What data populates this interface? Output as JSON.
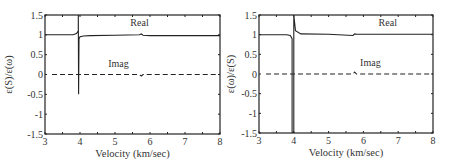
{
  "chart_data": [
    {
      "type": "line",
      "title": "",
      "xlabel": "Velocity (km/sec)",
      "ylabel": "ε(S)/ε(ω)",
      "xlim": [
        3,
        8
      ],
      "ylim": [
        -1.5,
        1.5
      ],
      "xticks": [
        "3",
        "4",
        "5",
        "6",
        "7",
        "8"
      ],
      "yticks": [
        "1.5",
        "1",
        "0.5",
        "0",
        "-0.5",
        "-1",
        "-1.5"
      ],
      "grid": false,
      "annotations": [
        {
          "text": "Real",
          "x": 5.7,
          "y": 1.22
        },
        {
          "text": "Imag",
          "x": 5.1,
          "y": 0.2
        }
      ],
      "series": [
        {
          "name": "Real",
          "style": "solid",
          "x": [
            3.0,
            3.8,
            3.9,
            3.95,
            3.95,
            3.96,
            3.97,
            4.0,
            4.1,
            4.3,
            5.0,
            5.7,
            5.75,
            5.8,
            6.0,
            8.0
          ],
          "y": [
            1.0,
            1.0,
            1.03,
            1.1,
            1.5,
            -0.5,
            0.9,
            0.95,
            0.97,
            0.98,
            0.99,
            1.0,
            1.02,
            0.99,
            0.98,
            0.98
          ]
        },
        {
          "name": "Imag",
          "style": "dashed",
          "x": [
            3.2,
            5.7,
            5.75,
            5.8,
            8.0
          ],
          "y": [
            0.0,
            0.0,
            -0.04,
            0.0,
            0.0
          ]
        }
      ]
    },
    {
      "type": "line",
      "title": "",
      "xlabel": "Velocity (km/sec)",
      "ylabel": "ε(ω)/ε(S)",
      "xlim": [
        3,
        8
      ],
      "ylim": [
        -1.5,
        1.5
      ],
      "xticks": [
        "3",
        "4",
        "5",
        "6",
        "7",
        "8"
      ],
      "yticks": [
        "1.5",
        "1",
        "0.5",
        "0",
        "-0.5",
        "-1",
        "-1.5"
      ],
      "grid": false,
      "annotations": [
        {
          "text": "Real",
          "x": 6.7,
          "y": 1.22
        },
        {
          "text": "Imag",
          "x": 6.2,
          "y": 0.2
        }
      ],
      "series": [
        {
          "name": "Real",
          "style": "solid",
          "x": [
            3.0,
            3.8,
            3.9,
            3.95,
            3.95,
            4.0,
            4.0,
            4.05,
            4.2,
            5.0,
            5.7,
            5.75,
            5.8,
            8.0
          ],
          "y": [
            1.0,
            1.0,
            0.98,
            0.9,
            -1.5,
            -1.5,
            1.5,
            1.1,
            1.02,
            1.01,
            0.98,
            1.02,
            1.01,
            1.01
          ]
        },
        {
          "name": "Imag",
          "style": "dashed",
          "x": [
            3.2,
            5.7,
            5.75,
            5.8,
            8.0
          ],
          "y": [
            0.0,
            0.0,
            0.05,
            0.0,
            0.0
          ]
        }
      ]
    }
  ]
}
